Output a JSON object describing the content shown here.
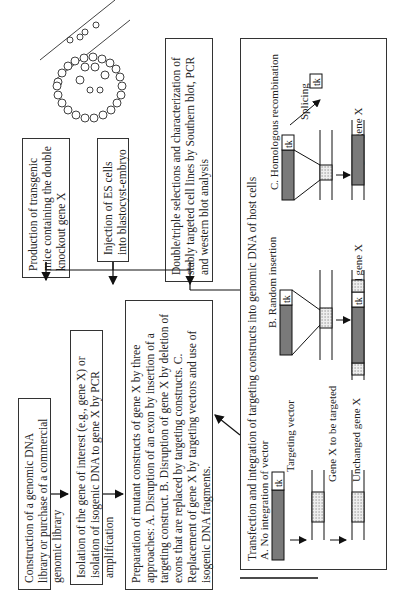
{
  "diagram": {
    "steps": [
      {
        "id": "construction",
        "text": "Construction of a genomic DNA library or purchase of a commercial genomic library"
      },
      {
        "id": "isolation",
        "text": "Isolation of the gene of interest (e.g., gene X) or isolation of isogenic DNA to gene X by PCR amplification"
      },
      {
        "id": "preparation",
        "text": "Preparation of mutant constructs of gene X by three approaches: A. Disruption of an exon by insertion of a targeting construct. B. Disruption of gene X by deletion of exons that are replaced by targeting constructs. C. Replacement of gene X by targeting vectors and use of isogenic DNA fragments."
      },
      {
        "id": "transfection",
        "text": "Transfection and integration of targeting constructs into genomic DNA of host cells"
      },
      {
        "id": "selection",
        "text": "Double/triple selections and characterization of stably targeted cell lines by Southern blot, PCR and western blot analysis"
      },
      {
        "id": "injection",
        "text": "Injection of ES cells into blastocyst-embryo"
      },
      {
        "id": "production",
        "text": "Production of transgenic mice containing the double knockout gene X"
      }
    ],
    "panel": {
      "a_title": "A. No integration of vector",
      "b_title": "B. Random insertion",
      "c_title": "C. Homologous recombination",
      "targeting_vector": "Targeting vector",
      "gene_to_target": "Gene X to be targeted",
      "unchanged": "Unchanged gene X",
      "mutated": "Mutated gene X",
      "targeted": "Targeted gene X",
      "splicing": "Splicing",
      "tk": "tk"
    },
    "colors": {
      "vector": "#7a7a7a",
      "line": "#222222",
      "dotted": "#e6e6e6"
    }
  }
}
